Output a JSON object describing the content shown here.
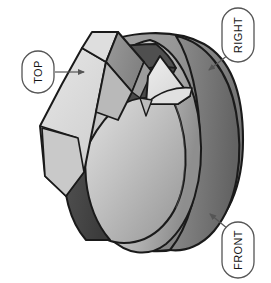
{
  "figure": {
    "type": "technical-illustration",
    "background_color": "#ffffff",
    "outline_color": "#1a1a1a",
    "palette": {
      "outline": "#1a1a1a",
      "prism_top_face": "#dcdcdc",
      "prism_side_face": "#8f8f8f",
      "prism_front_face": "#c8c8c8",
      "ribbon_dark": "#4a4a4a",
      "sphere_light": "#cfcfcf",
      "sphere_mid": "#a8a8a8",
      "sphere_shadow": "#6e6e6e",
      "wedge_light": "#e2e2e2",
      "callout_fill": "#ffffff",
      "callout_stroke": "#555555",
      "leader_line": "#555555"
    }
  },
  "callouts": [
    {
      "id": "top",
      "label": "TOP",
      "rotation_deg": -90,
      "bubble": {
        "cx": 38,
        "cy": 72,
        "rx": 16,
        "ry": 21
      },
      "leader": {
        "x1": 55,
        "y1": 72,
        "x2": 84,
        "y2": 72,
        "arrow": "right"
      }
    },
    {
      "id": "right",
      "label": "RIGHT",
      "rotation_deg": -90,
      "bubble": {
        "cx": 238,
        "cy": 35,
        "rx": 16,
        "ry": 27
      },
      "leader": {
        "x1": 228,
        "y1": 55,
        "x2": 208,
        "y2": 70,
        "arrow": "down-left"
      }
    },
    {
      "id": "front",
      "label": "FRONT",
      "rotation_deg": -90,
      "bubble": {
        "cx": 238,
        "cy": 250,
        "rx": 16,
        "ry": 28
      },
      "leader": {
        "x1": 228,
        "y1": 229,
        "x2": 209,
        "y2": 213,
        "arrow": "up-left"
      }
    }
  ]
}
